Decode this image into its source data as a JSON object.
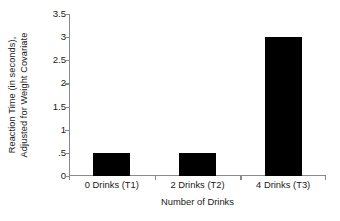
{
  "chart_data": {
    "type": "bar",
    "title": "",
    "categories": [
      "0 Drinks (T1)",
      "2 Drinks (T2)",
      "4 Drinks (T3)"
    ],
    "values": [
      0.5,
      0.5,
      3.0
    ],
    "xlabel": "Number of Drinks",
    "ylabel": "Reaction Time (in seconds), Adjusted for Weight Covariate",
    "ylabel_lines": [
      "Reaction Time (in seconds),",
      "Adjusted for Weight Covariate"
    ],
    "ylim": [
      0,
      3.5
    ],
    "ytick_values": [
      0,
      0.5,
      1,
      1.5,
      2,
      2.5,
      3,
      3.5
    ],
    "ytick_labels": [
      "0",
      ".5",
      "1",
      "1.5",
      "2",
      "2.5",
      "3",
      "3.5"
    ],
    "grid": false,
    "legend": false,
    "bar_color": "#000000",
    "axis_color": "#8a8a8a",
    "text_color": "#1a1a1a",
    "background": "#ffffff"
  }
}
